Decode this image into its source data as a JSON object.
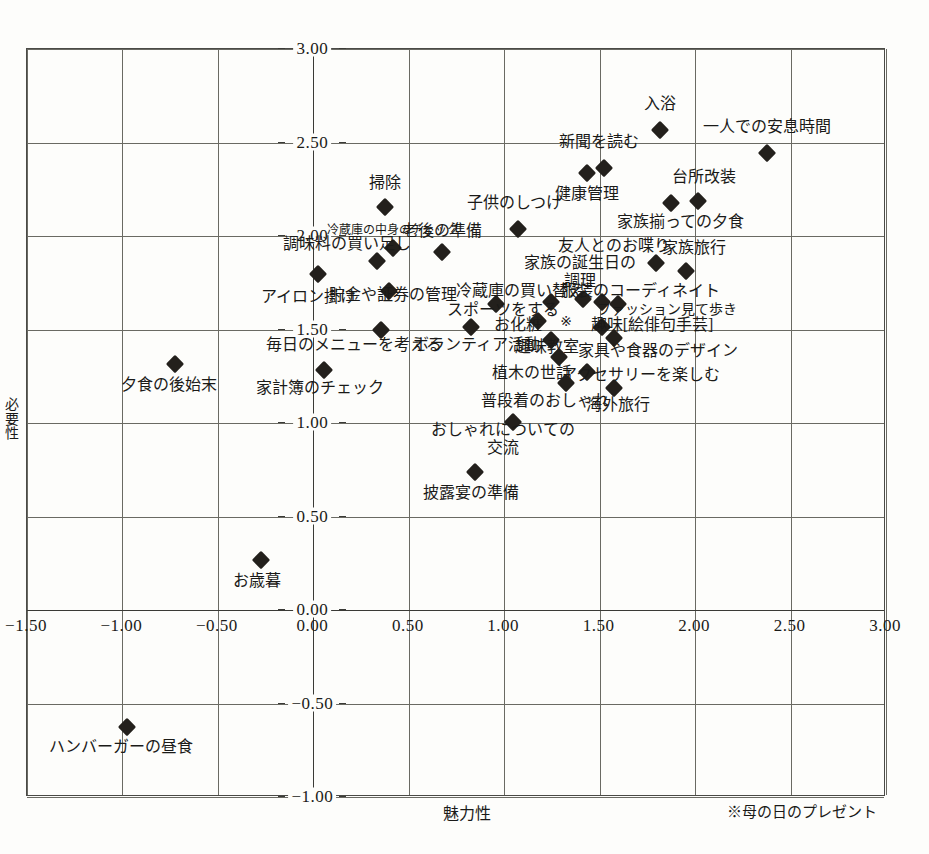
{
  "chart_data": {
    "type": "scatter",
    "title": "",
    "xlabel": "魅力性",
    "ylabel": "必要性",
    "xlim": [
      -1.5,
      3.0
    ],
    "ylim": [
      -1.0,
      3.0
    ],
    "xticks": [
      "-1.50",
      "-1.00",
      "-0.50",
      "0.00",
      "0.50",
      "1.00",
      "1.50",
      "2.00",
      "2.50",
      "3.00"
    ],
    "yticks": [
      "-1.00",
      "-0.50",
      "0.00",
      "0.50",
      "1.00",
      "1.50",
      "2.00",
      "2.50",
      "3.00"
    ],
    "grid": true,
    "legend": "none",
    "footnote": "※母の日のプレゼント",
    "points": [
      {
        "label": "入浴",
        "x": 1.82,
        "y": 2.56,
        "lx": 1.82,
        "ly": 2.7,
        "align": "center",
        "size": "normal",
        "marker": "diamond"
      },
      {
        "label": "一人での安息時間",
        "x": 2.38,
        "y": 2.44,
        "lx": 2.38,
        "ly": 2.58,
        "align": "center",
        "size": "normal",
        "marker": "diamond"
      },
      {
        "label": "新聞を読む",
        "x": 1.53,
        "y": 2.36,
        "lx": 1.5,
        "ly": 2.5,
        "align": "center",
        "size": "normal",
        "marker": "diamond"
      },
      {
        "label": "健康管理",
        "x": 1.44,
        "y": 2.33,
        "lx": 1.44,
        "ly": 2.22,
        "align": "center",
        "size": "normal",
        "marker": "diamond"
      },
      {
        "label": "台所改装",
        "x": 2.02,
        "y": 2.18,
        "lx": 2.05,
        "ly": 2.31,
        "align": "center",
        "size": "normal",
        "marker": "diamond"
      },
      {
        "label": "家族揃っての夕食",
        "x": 1.88,
        "y": 2.17,
        "lx": 1.93,
        "ly": 2.07,
        "align": "center",
        "size": "normal",
        "marker": "diamond"
      },
      {
        "label": "掃除",
        "x": 0.38,
        "y": 2.15,
        "lx": 0.38,
        "ly": 2.28,
        "align": "center",
        "size": "normal",
        "marker": "diamond"
      },
      {
        "label": "子供のしつけ",
        "x": 1.08,
        "y": 2.03,
        "lx": 1.06,
        "ly": 2.17,
        "align": "center",
        "size": "normal",
        "marker": "diamond"
      },
      {
        "label": "冷蔵庫の中身のチェック",
        "x": 0.42,
        "y": 1.93,
        "lx": 0.42,
        "ly": 2.02,
        "align": "center",
        "size": "small",
        "marker": "diamond"
      },
      {
        "label": "老後の準備",
        "x": 0.68,
        "y": 1.91,
        "lx": 0.68,
        "ly": 2.02,
        "align": "center",
        "size": "normal",
        "marker": "diamond"
      },
      {
        "label": "調味料の買い足し",
        "x": 0.34,
        "y": 1.86,
        "lx": 0.18,
        "ly": 1.95,
        "align": "center",
        "size": "normal",
        "marker": "diamond"
      },
      {
        "label": "友人とのお喋り",
        "x": 1.8,
        "y": 1.85,
        "lx": 1.58,
        "ly": 1.94,
        "align": "center",
        "size": "normal",
        "marker": "diamond"
      },
      {
        "label": "家族旅行",
        "x": 1.96,
        "y": 1.81,
        "lx": 2.0,
        "ly": 1.93,
        "align": "center",
        "size": "normal",
        "marker": "diamond"
      },
      {
        "label": "アイロン掛け",
        "x": 0.03,
        "y": 1.79,
        "lx": -0.02,
        "ly": 1.67,
        "align": "center",
        "size": "normal",
        "marker": "diamond"
      },
      {
        "label": "貯金や証券の管理",
        "x": 0.4,
        "y": 1.7,
        "lx": 0.42,
        "ly": 1.68,
        "align": "center",
        "size": "normal",
        "marker": "diamond"
      },
      {
        "label": "家族の誕生日の\n調理",
        "x": 1.42,
        "y": 1.66,
        "lx": 1.4,
        "ly": 1.8,
        "align": "center",
        "size": "normal",
        "marker": "diamond"
      },
      {
        "label": "冷蔵庫の買い替え",
        "x": 1.25,
        "y": 1.64,
        "lx": 1.09,
        "ly": 1.7,
        "align": "center",
        "size": "normal",
        "marker": "diamond"
      },
      {
        "label": "服装のコーディネイト",
        "x": 1.52,
        "y": 1.64,
        "lx": 1.72,
        "ly": 1.7,
        "align": "center",
        "size": "normal",
        "marker": "diamond"
      },
      {
        "label": "スポーツをする",
        "x": 0.96,
        "y": 1.63,
        "lx": 1.0,
        "ly": 1.6,
        "align": "center",
        "size": "normal",
        "marker": "diamond"
      },
      {
        "label": "ファッション見て歩き",
        "x": 1.6,
        "y": 1.63,
        "lx": 1.86,
        "ly": 1.6,
        "align": "center",
        "size": "mid",
        "marker": "diamond"
      },
      {
        "label": "お化粧",
        "x": 1.18,
        "y": 1.54,
        "lx": 1.08,
        "ly": 1.52,
        "align": "center",
        "size": "normal",
        "marker": "diamond"
      },
      {
        "label": "毎日のメニューを考える",
        "x": 0.36,
        "y": 1.49,
        "lx": 0.22,
        "ly": 1.41,
        "align": "center",
        "size": "normal",
        "marker": "diamond"
      },
      {
        "label": "ボランティア活動",
        "x": 0.83,
        "y": 1.51,
        "lx": 0.86,
        "ly": 1.41,
        "align": "center",
        "size": "normal",
        "marker": "diamond"
      },
      {
        "label": "趣味[絵俳句手芸]",
        "x": 1.52,
        "y": 1.51,
        "lx": 1.78,
        "ly": 1.52,
        "align": "center",
        "size": "normal",
        "marker": "diamond"
      },
      {
        "label": "母の日のプレゼント",
        "x": 1.33,
        "y": 1.54,
        "lx": 1.33,
        "ly": 1.54,
        "align": "center",
        "size": "normal",
        "marker": "star"
      },
      {
        "label": "趣味教室",
        "x": 1.25,
        "y": 1.44,
        "lx": 1.23,
        "ly": 1.4,
        "align": "center",
        "size": "normal",
        "marker": "diamond"
      },
      {
        "label": "家具や食器のデザイン",
        "x": 1.58,
        "y": 1.45,
        "lx": 1.81,
        "ly": 1.38,
        "align": "center",
        "size": "normal",
        "marker": "diamond"
      },
      {
        "label": "植木の世話",
        "x": 1.29,
        "y": 1.35,
        "lx": 1.15,
        "ly": 1.26,
        "align": "center",
        "size": "normal",
        "marker": "diamond"
      },
      {
        "label": "アクセサリーを楽しむ",
        "x": 1.44,
        "y": 1.27,
        "lx": 1.72,
        "ly": 1.25,
        "align": "center",
        "size": "normal",
        "marker": "diamond"
      },
      {
        "label": "普段着のおしゃれ",
        "x": 1.33,
        "y": 1.21,
        "lx": 1.22,
        "ly": 1.11,
        "align": "center",
        "size": "normal",
        "marker": "diamond"
      },
      {
        "label": "海外旅行",
        "x": 1.58,
        "y": 1.18,
        "lx": 1.6,
        "ly": 1.09,
        "align": "center",
        "size": "normal",
        "marker": "diamond"
      },
      {
        "label": "家計簿のチェック",
        "x": 0.06,
        "y": 1.28,
        "lx": 0.04,
        "ly": 1.18,
        "align": "center",
        "size": "normal",
        "marker": "diamond"
      },
      {
        "label": "夕食の後始末",
        "x": -0.72,
        "y": 1.31,
        "lx": -0.75,
        "ly": 1.2,
        "align": "center",
        "size": "normal",
        "marker": "diamond"
      },
      {
        "label": "おしゃれについての\n交流",
        "x": 1.05,
        "y": 1.0,
        "lx": 1.0,
        "ly": 0.91,
        "align": "center",
        "size": "normal",
        "marker": "diamond"
      },
      {
        "label": "披露宴の準備",
        "x": 0.85,
        "y": 0.73,
        "lx": 0.83,
        "ly": 0.62,
        "align": "center",
        "size": "normal",
        "marker": "diamond"
      },
      {
        "label": "お歳暮",
        "x": -0.27,
        "y": 0.26,
        "lx": -0.29,
        "ly": 0.15,
        "align": "center",
        "size": "normal",
        "marker": "diamond"
      },
      {
        "label": "ハンバーガーの昼食",
        "x": -0.97,
        "y": -0.63,
        "lx": -1.0,
        "ly": -0.74,
        "align": "center",
        "size": "normal",
        "marker": "diamond"
      }
    ]
  }
}
